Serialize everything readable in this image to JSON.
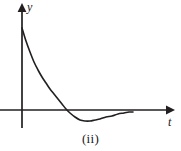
{
  "figure": {
    "caption": "(ii)",
    "background_color": "#ffffff",
    "ink_color": "#231f20",
    "axes": {
      "vertical": {
        "label": "y",
        "arrow": "arrow-up",
        "x_position": 22,
        "top": 6,
        "bottom": 128
      },
      "horizontal": {
        "label": "t",
        "arrow": "arrow-right",
        "y_position": 110,
        "left": 0,
        "right": 172
      }
    }
  },
  "chart_data": {
    "type": "line",
    "title": "",
    "subtitle": "",
    "xlabel": "t",
    "ylabel": "y",
    "grid": false,
    "legend": null,
    "axis_style": "arrow-axes-no-ticks",
    "xlim": [
      0,
      172
    ],
    "ylim": [
      -20,
      105
    ],
    "origin_px": [
      22,
      110
    ],
    "annotations": [
      {
        "text": "(ii)",
        "role": "figure-caption",
        "position": "below-axes"
      }
    ],
    "series": [
      {
        "name": "damped decay curve",
        "description": "Starts high on the y-axis, decays steeply, crosses the t-axis, dips to a single minimum below the axis, then rises back toward the axis and levels off.",
        "color": "#231f20",
        "linewidth": 1.6,
        "x": [
          22,
          26,
          30,
          34,
          38,
          42,
          46,
          50,
          54,
          58,
          62,
          66,
          70,
          75,
          80,
          85,
          90,
          95,
          100,
          106,
          112,
          118,
          124,
          129,
          133
        ],
        "y": [
          82,
          69,
          58,
          48,
          40,
          33,
          27,
          21,
          16,
          11,
          6,
          1,
          -3,
          -7,
          -10,
          -11,
          -11,
          -10,
          -9,
          -7,
          -6,
          -4,
          -3,
          -2,
          -2
        ],
        "x_pixels": [
          22,
          26,
          30,
          34,
          38,
          42,
          46,
          50,
          54,
          58,
          62,
          66,
          70,
          75,
          80,
          85,
          90,
          95,
          100,
          106,
          112,
          118,
          124,
          129,
          133
        ],
        "y_pixels": [
          28,
          41,
          52,
          62,
          70,
          77,
          83,
          89,
          94,
          99,
          104,
          109,
          113,
          117,
          120,
          121,
          121,
          120,
          119,
          117,
          116,
          114,
          113,
          112,
          112
        ],
        "zero_crossing_px": 62,
        "minimum_px": [
          88,
          121.5
        ],
        "start_px": [
          22,
          28
        ],
        "end_px": [
          133,
          112
        ]
      }
    ]
  }
}
